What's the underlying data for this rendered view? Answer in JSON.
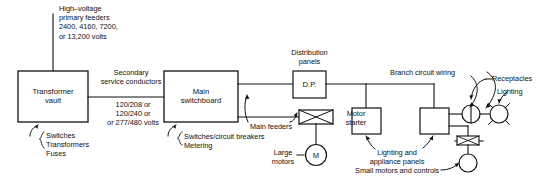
{
  "diagram": {
    "line_color": "#111111",
    "background": "#ffffff"
  },
  "labels": {
    "primary_feeders": "High–voltage\nprimary feeders\n2400, 4160, 7200,\nor 13,200 volts",
    "secondary_conductors": "Secondary\nservice conductors",
    "secondary_voltages": "120/208 or\n120/240 or\nor 277/480 volts",
    "vault_contents": "Switches\nTransformers\nFuses",
    "switchboard_contents": "Switches/circuit breakers\nMetering",
    "main_feeders": "Main feeders",
    "distribution_panels": "Distribution\npanels",
    "motor_starter": "Motor\nstarter",
    "large_motors": "Large\nmotors",
    "branch_circuit_wiring": "Branch circuit wiring",
    "lighting_appliance_panels": "Lighting and\nappliance panels",
    "small_motors_controls": "Small motors and controls",
    "receptacles": "Receptacles",
    "lighting": "Lighting"
  },
  "boxes": {
    "transformer_vault": "Transformer\nvault",
    "main_switchboard": "Main\nswitchboard",
    "distribution_panel": "D.P.",
    "lighting_panel_1": "",
    "lighting_panel_2": ""
  },
  "symbols": {
    "large_motor": "M",
    "motor_starter_icon": "starter-bowtie-icon",
    "receptacle_icon": "receptacle-circle-icon",
    "lighting_icon": "lighting-starburst-icon",
    "small_motor_icon": "small-motor-circle-icon"
  }
}
